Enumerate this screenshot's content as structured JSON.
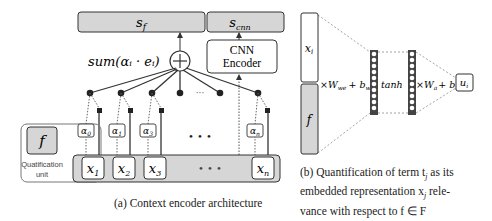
{
  "figure_a": {
    "top_bar_left": "s",
    "top_bar_left_sub": "f",
    "top_bar_right": "s",
    "top_bar_right_sub": "cnn",
    "sum_label": "sum(α",
    "sum_label_full": "sum(αᵢ · eᵢ)",
    "cnn_encoder_line1": "CNN",
    "cnn_encoder_line2": "Encoder",
    "dots_top": "···",
    "dots_alpha": "• • •",
    "dots_x": "• • •",
    "quantification_symbol": "f",
    "quantification_label_line1": "Quatification",
    "quantification_label_line2": "unit",
    "alphas": [
      {
        "base": "α",
        "sub": "0"
      },
      {
        "base": "α",
        "sub": "1"
      },
      {
        "base": "α",
        "sub": "3"
      },
      {
        "base": "α",
        "sub": "n"
      }
    ],
    "inputs": [
      {
        "base": "x",
        "sub": "1"
      },
      {
        "base": "x",
        "sub": "2"
      },
      {
        "base": "x",
        "sub": "3"
      },
      {
        "base": "x",
        "sub": "n"
      }
    ],
    "caption": "(a) Context encoder architecture"
  },
  "figure_b": {
    "top_vector": {
      "base": "x",
      "sub": "i"
    },
    "bottom_vector": "f",
    "transform1": "×W",
    "transform1_sub": "we",
    "transform1_bias": "+ b",
    "transform1_bias_sub": "we",
    "activation": "tanh",
    "transform2": "×W",
    "transform2_sub": "a",
    "transform2_bias": "+ b",
    "transform2_bias_sub": "a",
    "output": {
      "base": "u",
      "sub": "i"
    },
    "caption_line1": "(b) Quantification of term t",
    "caption_line1_sub": "j",
    "caption_line1_end": " as its",
    "caption_line2": "embedded representation x",
    "caption_line2_sub": "j",
    "caption_line2_end": " rele-",
    "caption_line3": "vance with respect to f ∈ F"
  },
  "colors": {
    "gray_fill": "#d6d6d6",
    "box_stroke": "#333333",
    "line": "#333333",
    "dotted": "#555555"
  }
}
